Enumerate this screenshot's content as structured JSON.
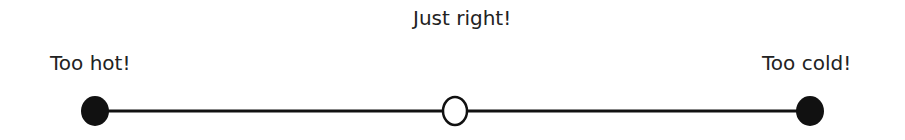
{
  "scale": {
    "labels": {
      "center": "Just right!",
      "left": "Too hot!",
      "right": "Too cold!"
    },
    "points": [
      {
        "position": "left",
        "style": "filled"
      },
      {
        "position": "center",
        "style": "open"
      },
      {
        "position": "right",
        "style": "filled"
      }
    ],
    "line_color": "#111111"
  }
}
